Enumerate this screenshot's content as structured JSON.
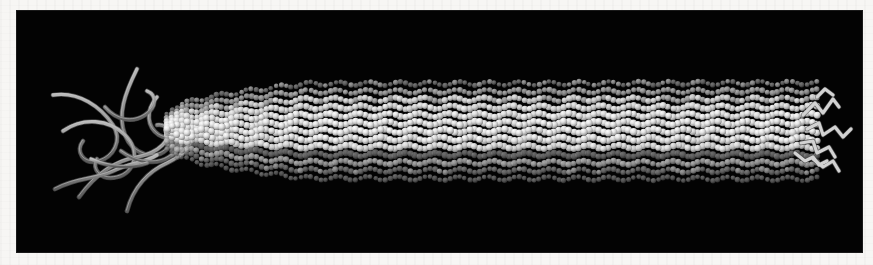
{
  "figure": {
    "kind": "molecular-structure-render",
    "background_color": "#f7f6f4",
    "panel_color": "#030303",
    "panel": {
      "x": 17,
      "y": 11,
      "width": 845,
      "height": 241
    },
    "title": "",
    "caption": "",
    "labels": [],
    "axis_labels": [],
    "scale_bar": ""
  },
  "render": {
    "palette": {
      "background": "#f7f6f4",
      "panel": "#030303",
      "subunit_light": "#ededed",
      "subunit_mid": "#c2c2c2",
      "subunit_dark": "#6e6e6e",
      "groove": "#1b1b1b",
      "strand": "#8a8a8a",
      "strand_highlight": "#c9c9c9",
      "strand_shadow": "#4a4a4a"
    },
    "rod": {
      "tip_left_x": 150,
      "tip_left_y": 122,
      "end_right_x": 800,
      "axis_y": 120,
      "half_height_min": 17,
      "half_height_max": 47,
      "taper_end_x": 290,
      "subunit_radius": 3.1,
      "rows": 13,
      "helix_pitch_px": 30,
      "columns": 132
    },
    "left_tangle": {
      "center_x": 95,
      "center_y": 125,
      "radius_x": 78,
      "radius_y": 72,
      "strand_count": 11,
      "strand_width": 3.4
    },
    "right_strands": {
      "origin_x": 795,
      "origin_y": 120,
      "strand_count": 6,
      "strand_width": 3.2,
      "zigzag": true
    }
  },
  "chart_data": {
    "type": "scatter",
    "title": "",
    "xlabel": "",
    "ylabel": "",
    "categories": [],
    "values": []
  }
}
